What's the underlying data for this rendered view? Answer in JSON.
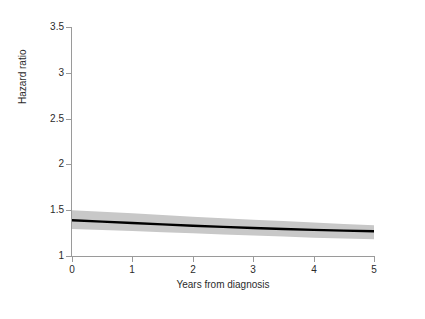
{
  "figure": {
    "background_color": "#ffffff",
    "plot_background_color": "#ffffff"
  },
  "chart_data": {
    "type": "line",
    "title": "",
    "subtitle": "",
    "xlabel": "Years from diagnosis",
    "ylabel": "Hazard ratio",
    "xlim": [
      0,
      5
    ],
    "ylim": [
      1,
      3.5
    ],
    "xticks": [
      0,
      1,
      2,
      3,
      4,
      5
    ],
    "xticklabels": [
      "0",
      "1",
      "2",
      "3",
      "4",
      "5"
    ],
    "yticks": [
      1,
      1.5,
      2,
      2.5,
      3,
      3.5
    ],
    "yticklabels": [
      "1",
      "1.5",
      "2",
      "2.5",
      "3",
      "3.5"
    ],
    "grid": false,
    "legend": "none",
    "series": [
      {
        "name": "Hazard ratio",
        "kind": "line",
        "color": "#000000",
        "line_width": 2.4,
        "x": [
          0,
          0.5,
          1,
          1.5,
          2,
          2.5,
          3,
          3.5,
          4,
          4.5,
          5
        ],
        "values": [
          1.39,
          1.375,
          1.36,
          1.345,
          1.33,
          1.318,
          1.306,
          1.295,
          1.285,
          1.277,
          1.27
        ]
      },
      {
        "name": "95% confidence interval",
        "kind": "band",
        "color": "#c8c8c8",
        "x": [
          0,
          0.5,
          1,
          1.5,
          2,
          2.5,
          3,
          3.5,
          4,
          4.5,
          5
        ],
        "upper": [
          1.5,
          1.483,
          1.466,
          1.447,
          1.429,
          1.412,
          1.396,
          1.381,
          1.366,
          1.35,
          1.335
        ],
        "lower": [
          1.295,
          1.285,
          1.272,
          1.26,
          1.247,
          1.235,
          1.223,
          1.212,
          1.2,
          1.19,
          1.182
        ]
      }
    ],
    "axis_color": "#9a9a9a",
    "tick_label_color": "#2b2b2b"
  },
  "axis_titles": {
    "x": "Years from diagnosis",
    "y": "Hazard ratio"
  }
}
